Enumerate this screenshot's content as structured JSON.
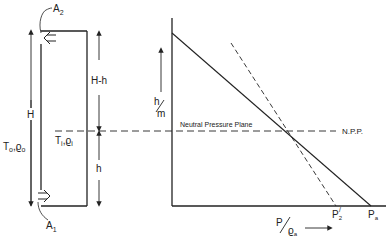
{
  "diagram": {
    "type": "neutral-pressure-plane",
    "colors": {
      "ink": "#222222",
      "background": "#ffffff"
    },
    "building": {
      "top_opening_label": "A",
      "top_opening_sub": "2",
      "bottom_opening_label": "A",
      "bottom_opening_sub": "1",
      "height_label": "H",
      "upper_height_label": "H-h",
      "lower_height_label": "h",
      "outside_conditions": "T",
      "outside_conditions_sub": "o",
      "outside_conditions_rho": "ϱ",
      "outside_conditions_rho_sub": "o",
      "inside_conditions": "T",
      "inside_conditions_sub": "i",
      "inside_conditions_rho": "ϱ",
      "inside_conditions_rho_sub": "i"
    },
    "graph": {
      "y_axis_label_num": "h",
      "y_axis_label_den": "m",
      "x_axis_label_num": "P",
      "x_axis_label_den": "ϱ",
      "x_axis_label_den_sub": "a",
      "neutral_plane_label": "Neutral Pressure Plane",
      "npp_abbrev": "N.P.P.",
      "p2_label": "P",
      "p2_sub": "2",
      "pa_label": "P",
      "pa_sub": "a"
    }
  }
}
